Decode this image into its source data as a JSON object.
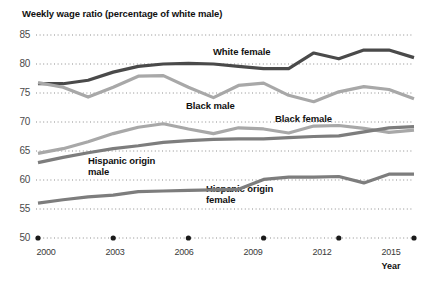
{
  "chart_data": {
    "type": "line",
    "title": "Weekly wage ratio (percentage of white male)",
    "xlabel": "Year",
    "ylabel": "",
    "xlim": [
      2000,
      2015
    ],
    "ylim": [
      50,
      85
    ],
    "yticks": [
      85,
      80,
      75,
      70,
      65,
      60,
      55,
      50
    ],
    "xticks": [
      2000,
      2003,
      2006,
      2009,
      2012,
      2015
    ],
    "grid": true,
    "grid_style": "dotted",
    "legend": "inline-labels",
    "x": [
      2000,
      2001,
      2002,
      2003,
      2004,
      2005,
      2006,
      2007,
      2008,
      2009,
      2010,
      2011,
      2012,
      2013,
      2014,
      2015
    ],
    "series": [
      {
        "name": "White female",
        "color": "#4a4a4a",
        "values": [
          76.6,
          76.6,
          77.2,
          78.6,
          79.6,
          80.0,
          80.1,
          80.0,
          79.6,
          79.2,
          79.2,
          81.9,
          80.9,
          82.4,
          82.4,
          81.1
        ]
      },
      {
        "name": "Black male",
        "color": "#a8a8a8",
        "values": [
          76.8,
          76.0,
          74.3,
          76.0,
          77.9,
          78.0,
          76.0,
          74.2,
          76.3,
          76.7,
          74.6,
          73.5,
          75.2,
          76.1,
          75.6,
          74.0
        ]
      },
      {
        "name": "Black female",
        "color": "#a8a8a8",
        "values": [
          64.6,
          65.4,
          66.6,
          68.0,
          69.1,
          69.7,
          68.8,
          68.0,
          69.0,
          68.8,
          68.1,
          69.3,
          69.4,
          68.9,
          68.2,
          68.6
        ]
      },
      {
        "name": "Hispanic origin male",
        "color": "#7d7d7d",
        "values": [
          63.0,
          63.9,
          64.7,
          65.4,
          65.9,
          66.5,
          66.8,
          67.0,
          67.1,
          67.1,
          67.3,
          67.5,
          67.6,
          68.3,
          69.0,
          69.2
        ]
      },
      {
        "name": "Hispanic origin female",
        "color": "#7d7d7d",
        "values": [
          56.0,
          56.6,
          57.1,
          57.4,
          58.0,
          58.1,
          58.2,
          58.3,
          58.4,
          60.1,
          60.5,
          60.5,
          60.6,
          59.5,
          61.0,
          61.0
        ]
      }
    ],
    "annotations": [
      {
        "text": "White female",
        "series": "White female"
      },
      {
        "text": "Black male",
        "series": "Black male"
      },
      {
        "text": "Black female",
        "series": "Black female"
      },
      {
        "text": "Hispanic origin\nmale",
        "series": "Hispanic origin male"
      },
      {
        "text": "Hispanic origin\nfemale",
        "series": "Hispanic origin female"
      }
    ]
  },
  "labels": {
    "title": "Weekly wage ratio (percentage of white male)",
    "year_axis": "Year",
    "white_female": "White female",
    "black_male": "Black male",
    "black_female": "Black female",
    "hispanic_male": "Hispanic origin\nmale",
    "hispanic_female": "Hispanic origin\nfemale",
    "y_85": "85",
    "y_80": "80",
    "y_75": "75",
    "y_70": "70",
    "y_65": "65",
    "y_60": "60",
    "y_55": "55",
    "y_50": "50",
    "x_2000": "2000",
    "x_2003": "2003",
    "x_2006": "2006",
    "x_2009": "2009",
    "x_2012": "2012",
    "x_2015": "2015"
  }
}
